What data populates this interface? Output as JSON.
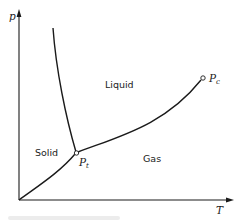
{
  "diagram": {
    "type": "phase-diagram",
    "axes": {
      "y_label": "p",
      "x_label": "T"
    },
    "regions": {
      "solid": "Solid",
      "liquid": "Liquid",
      "gas": "Gas"
    },
    "points": {
      "triple": {
        "symbol": "P",
        "subscript": "t"
      },
      "critical": {
        "symbol": "P",
        "subscript": "c"
      }
    },
    "curves": [
      {
        "name": "sublimation-curve",
        "from": "origin",
        "to": "triple-point"
      },
      {
        "name": "melting-curve",
        "from": "triple-point",
        "to": "top"
      },
      {
        "name": "vaporization-curve",
        "from": "triple-point",
        "to": "critical-point"
      }
    ],
    "colors": {
      "line": "#1a1a1a",
      "text": "#222222",
      "background": "#ffffff"
    }
  }
}
